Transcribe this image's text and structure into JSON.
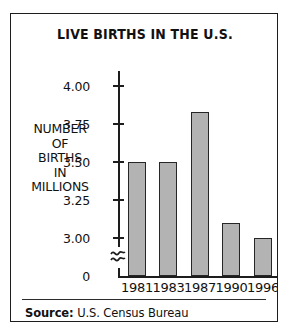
{
  "chart_data": {
    "type": "bar",
    "title": "LIVE BIRTHS IN THE U.S.",
    "xlabel": "",
    "ylabel": "NUMBER OF BIRTHS IN MILLIONS",
    "ylabel_lines": [
      "NUMBER",
      "OF",
      "BIRTHS",
      "IN",
      "MILLIONS"
    ],
    "categories": [
      "1981",
      "1983",
      "1987",
      "1990",
      "1996"
    ],
    "values": [
      3.5,
      3.5,
      3.83,
      3.1,
      3.0
    ],
    "ytick_labels": [
      "4.00",
      "3.75",
      "3.50",
      "3.25",
      "3.00",
      "0"
    ],
    "ytick_values": [
      4.0,
      3.75,
      3.5,
      3.25,
      3.0,
      0
    ],
    "ylim": [
      2.9,
      4.0
    ],
    "axis_break": true,
    "axis_break_symbol": "double-squiggle",
    "grid": false,
    "legend": false,
    "bar_fill_color": "#b3b3b3",
    "bar_edge_color": "#262626",
    "axis_color": "#1d1d1d",
    "background_color": "#ffffff"
  },
  "footer": {
    "source_label": "Source:",
    "source_value": "U.S. Census Bureau"
  }
}
